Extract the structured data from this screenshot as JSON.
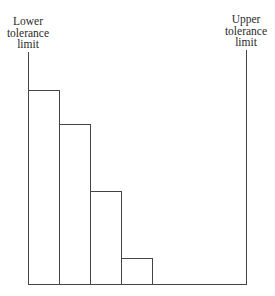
{
  "chart_data": {
    "type": "bar",
    "title": "",
    "xlabel": "",
    "ylabel": "",
    "annotations": [
      {
        "text": "Lower tolerance limit",
        "position": "left"
      },
      {
        "text": "Upper tolerance limit",
        "position": "right"
      }
    ],
    "categories": [
      "1",
      "2",
      "3",
      "4"
    ],
    "values": [
      194,
      160,
      93,
      26
    ],
    "grid": false,
    "legend": null,
    "note": "Histogram truncated at lower tolerance limit, skewed toward it; heights in pixel units relative to baseline"
  },
  "labels": {
    "lower": [
      "Lower",
      "tolerance",
      "limit"
    ],
    "upper": [
      "Upper",
      "tolerance",
      "limit"
    ]
  },
  "layout": {
    "baseline_y": 284,
    "lower_limit_x": 28,
    "upper_limit_x": 246,
    "bar_width": 31
  }
}
